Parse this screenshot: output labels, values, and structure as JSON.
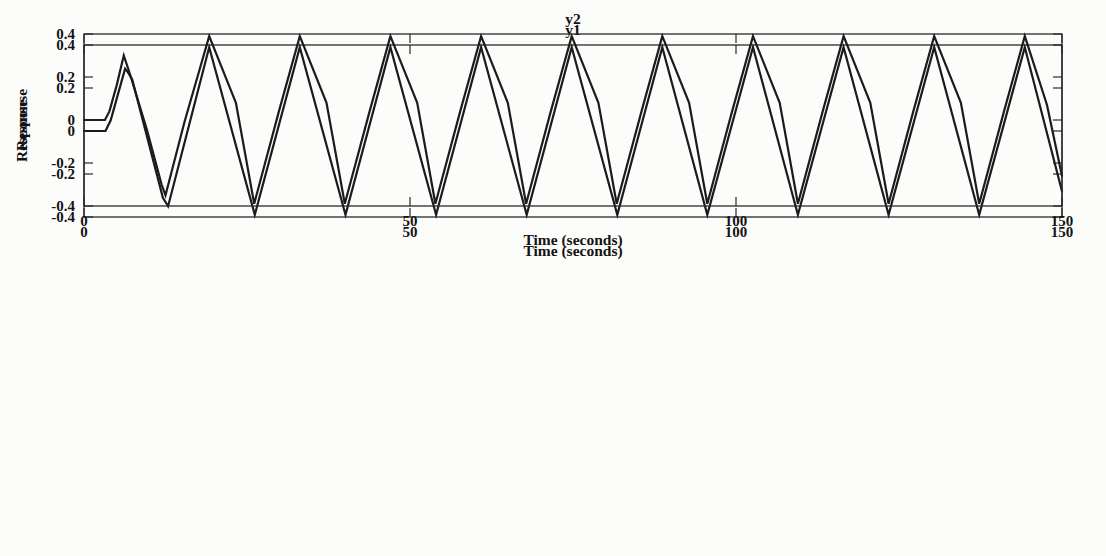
{
  "figure": {
    "background": "#fcfcfa",
    "line_color": "#1b1b1b",
    "axis_color": "#2a2a2a",
    "text_color": "#131313"
  },
  "chart_data": [
    {
      "type": "line",
      "title": "y1",
      "xlabel": "Time (seconds)",
      "ylabel": "Response",
      "xlim": [
        0,
        150
      ],
      "ylim": [
        -0.4,
        0.4
      ],
      "xticks": [
        0,
        50,
        100,
        150
      ],
      "xtick_labels": [
        "0",
        "50",
        "100",
        "150"
      ],
      "yticks": [
        0.4,
        0.2,
        0,
        -0.2,
        -0.4
      ],
      "ytick_labels": [
        "0.4",
        "0.2",
        "0",
        "-0.2",
        "-0.4"
      ],
      "grid": false,
      "legend": "none",
      "series": [
        {
          "name": "y1",
          "points": [
            [
              0,
              0
            ],
            [
              3.3,
              0
            ],
            [
              4.1,
              0.05
            ],
            [
              5.1,
              0.16
            ],
            [
              6.3,
              0.29
            ],
            [
              6.8,
              0.27
            ],
            [
              7.4,
              0.24
            ],
            [
              12.1,
              -0.31
            ],
            [
              12.9,
              -0.35
            ],
            [
              19.2,
              0.39
            ],
            [
              26.2,
              -0.39
            ],
            [
              33.1,
              0.39
            ],
            [
              40.1,
              -0.39
            ],
            [
              47.0,
              0.39
            ],
            [
              54.0,
              -0.39
            ],
            [
              60.9,
              0.39
            ],
            [
              67.9,
              -0.39
            ],
            [
              74.8,
              0.39
            ],
            [
              81.8,
              -0.39
            ],
            [
              88.7,
              0.39
            ],
            [
              95.6,
              -0.39
            ],
            [
              102.6,
              0.39
            ],
            [
              109.5,
              -0.39
            ],
            [
              116.5,
              0.39
            ],
            [
              123.4,
              -0.39
            ],
            [
              130.4,
              0.39
            ],
            [
              137.3,
              -0.39
            ],
            [
              144.3,
              0.39
            ],
            [
              150,
              -0.28
            ]
          ]
        }
      ]
    },
    {
      "type": "line",
      "title": "y2",
      "xlabel": "Time (seconds)",
      "ylabel": "Response",
      "xlim": [
        0,
        150
      ],
      "ylim": [
        -0.4,
        0.4
      ],
      "xticks": [
        0,
        50,
        100,
        150
      ],
      "xtick_labels": [
        "0",
        "50",
        "100",
        "150"
      ],
      "yticks": [
        0.4,
        0.2,
        0,
        -0.2,
        -0.4
      ],
      "ytick_labels": [
        "0.4",
        "0.2",
        "0",
        "-0.2",
        "-0.4"
      ],
      "grid": false,
      "legend": "none",
      "series": [
        {
          "name": "y2",
          "points": [
            [
              0,
              0
            ],
            [
              3.2,
              0
            ],
            [
              3.9,
              0.04
            ],
            [
              5.0,
              0.16
            ],
            [
              6.1,
              0.3
            ],
            [
              7.2,
              0.2
            ],
            [
              9.7,
              -0.05
            ],
            [
              11.9,
              -0.3
            ],
            [
              12.5,
              -0.35
            ],
            [
              15.4,
              -0.01
            ],
            [
              19.2,
              0.39
            ],
            [
              23.3,
              0.08
            ],
            [
              26.1,
              -0.39
            ],
            [
              29.9,
              0.04
            ],
            [
              33.1,
              0.39
            ],
            [
              37.2,
              0.08
            ],
            [
              40.0,
              -0.39
            ],
            [
              43.8,
              0.04
            ],
            [
              47.0,
              0.39
            ],
            [
              51.1,
              0.08
            ],
            [
              53.9,
              -0.39
            ],
            [
              57.7,
              0.04
            ],
            [
              60.9,
              0.39
            ],
            [
              65.0,
              0.08
            ],
            [
              67.8,
              -0.39
            ],
            [
              71.6,
              0.04
            ],
            [
              74.8,
              0.39
            ],
            [
              78.9,
              0.08
            ],
            [
              81.7,
              -0.39
            ],
            [
              85.5,
              0.04
            ],
            [
              88.7,
              0.39
            ],
            [
              92.8,
              0.08
            ],
            [
              95.6,
              -0.39
            ],
            [
              99.4,
              0.04
            ],
            [
              102.6,
              0.39
            ],
            [
              106.7,
              0.08
            ],
            [
              109.5,
              -0.39
            ],
            [
              113.3,
              0.04
            ],
            [
              116.5,
              0.39
            ],
            [
              120.6,
              0.08
            ],
            [
              123.4,
              -0.39
            ],
            [
              127.2,
              0.04
            ],
            [
              130.4,
              0.39
            ],
            [
              134.5,
              0.08
            ],
            [
              137.3,
              -0.39
            ],
            [
              141.1,
              0.04
            ],
            [
              144.3,
              0.39
            ],
            [
              147.7,
              0.07
            ],
            [
              150,
              -0.26
            ]
          ]
        }
      ]
    }
  ]
}
